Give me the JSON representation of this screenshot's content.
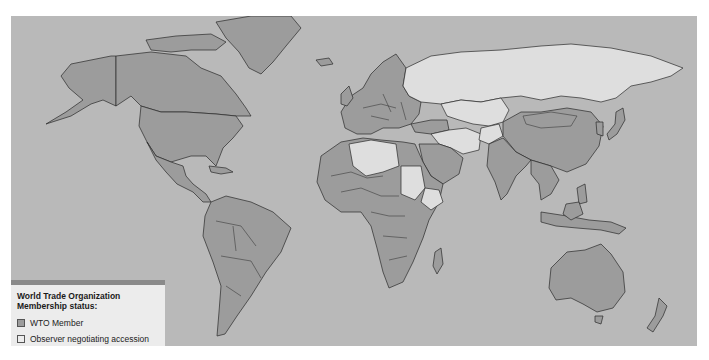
{
  "map": {
    "title": "World Trade Organization membership map",
    "colors": {
      "ocean": "#b9b9b9",
      "member": "#9c9c9c",
      "observer": "#dedede",
      "border": "#2a2a2a"
    }
  },
  "legend": {
    "title_line1": "World Trade Organization",
    "title_line2": "Membership status:",
    "items": [
      {
        "label": "WTO Member",
        "status": "member"
      },
      {
        "label": "Observer negotiating accession",
        "status": "observer"
      }
    ]
  }
}
